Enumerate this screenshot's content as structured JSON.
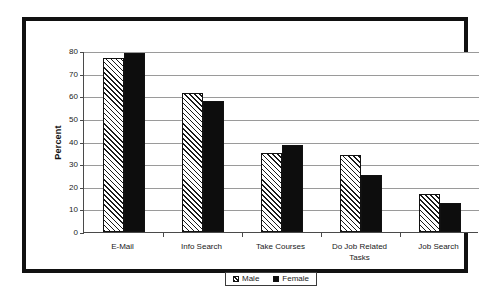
{
  "chart_data": {
    "type": "bar",
    "title": "",
    "subtitle": "",
    "xlabel": "",
    "ylabel": "Percent",
    "ylim": [
      0,
      80
    ],
    "ytick_values": [
      0,
      10,
      20,
      30,
      40,
      50,
      60,
      70,
      80
    ],
    "ytick_labels": [
      "0",
      "10",
      "20",
      "30",
      "40",
      "50",
      "60",
      "70",
      "80"
    ],
    "grid": true,
    "legend_position": "bottom-center",
    "categories": [
      "E-Mail",
      "Info Search",
      "Take Courses",
      "Do Job Related Tasks",
      "Job Search"
    ],
    "category_lines": [
      [
        "E-Mail"
      ],
      [
        "Info Search"
      ],
      [
        "Take Courses"
      ],
      [
        "Do Job Related",
        "Tasks"
      ],
      [
        "Job Search"
      ]
    ],
    "series": [
      {
        "name": "Male",
        "fill": "diagonal-hatch",
        "color": "#ffffff",
        "edge_color": "#111111",
        "values": [
          77,
          61.5,
          35,
          34,
          17
        ]
      },
      {
        "name": "Female",
        "fill": "solid",
        "color": "#0d0d0d",
        "edge_color": "#111111",
        "values": [
          79,
          58,
          38.5,
          25,
          13
        ]
      }
    ]
  },
  "legend": {
    "entries": [
      {
        "label": "Male"
      },
      {
        "label": "Female"
      }
    ]
  },
  "colors": {
    "frame": "#111111",
    "gridline": "#9a9a9a",
    "axis": "#4a4a4a",
    "background": "#ffffff"
  }
}
